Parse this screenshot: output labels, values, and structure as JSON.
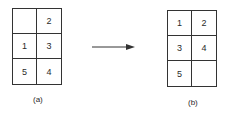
{
  "diagram": {
    "left": {
      "label": "(a)",
      "cells": [
        "",
        "2",
        "1",
        "3",
        "5",
        "4"
      ]
    },
    "right": {
      "label": "(b)",
      "cells": [
        "1",
        "2",
        "3",
        "4",
        "5",
        ""
      ]
    },
    "arrow": "right-arrow-icon"
  }
}
